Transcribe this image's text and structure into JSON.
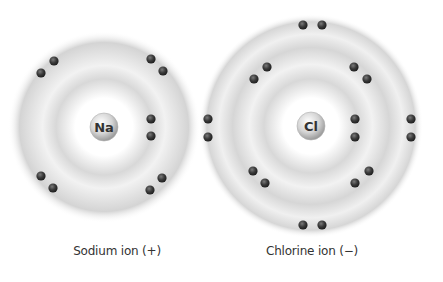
{
  "ions": [
    {
      "id": "sodium",
      "symbol": "Na",
      "label": "Sodium ion (+)",
      "charge": "+",
      "center": [
        104,
        127
      ],
      "outer_radius": 96,
      "inner_band_radius": 52,
      "nucleus_radius": 14,
      "label_pos": [
        117,
        253
      ],
      "electrons": [
        [
          54,
          61
        ],
        [
          41,
          73
        ],
        [
          151,
          59
        ],
        [
          163,
          71
        ],
        [
          151,
          119
        ],
        [
          151,
          136
        ],
        [
          41,
          176
        ],
        [
          53,
          188
        ],
        [
          162,
          178
        ],
        [
          150,
          190
        ]
      ]
    },
    {
      "id": "chlorine",
      "symbol": "Cl",
      "label": "Chlorine ion (−)",
      "charge": "−",
      "center": [
        311,
        126
      ],
      "outer_radius": 112,
      "inner_band_radius": 60,
      "nucleus_radius": 14,
      "label_pos": [
        312,
        253
      ],
      "electrons": [
        [
          303,
          25
        ],
        [
          322,
          25
        ],
        [
          303,
          225
        ],
        [
          322,
          225
        ],
        [
          208,
          119
        ],
        [
          208,
          137
        ],
        [
          411,
          119
        ],
        [
          411,
          137
        ],
        [
          267,
          67
        ],
        [
          254,
          79
        ],
        [
          354,
          67
        ],
        [
          367,
          79
        ],
        [
          355,
          119
        ],
        [
          355,
          137
        ],
        [
          253,
          171
        ],
        [
          265,
          183
        ],
        [
          369,
          171
        ],
        [
          355,
          183
        ]
      ]
    }
  ],
  "colors": {
    "shell_gray": "#c8c8c8",
    "electron": "#3a3a3a",
    "nucleus": "#d6d6d6",
    "text": "#333333"
  }
}
